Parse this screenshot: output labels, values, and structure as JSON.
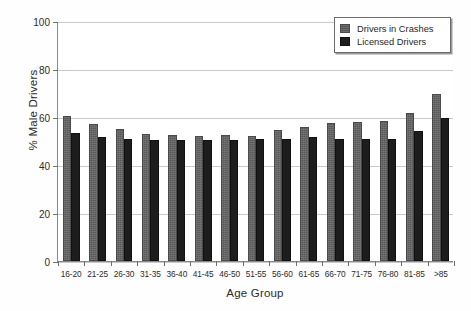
{
  "chart_data": {
    "type": "bar",
    "title": "",
    "xlabel": "Age Group",
    "ylabel": "% Male Drivers",
    "ylim": [
      0,
      100
    ],
    "yticks": [
      0,
      20,
      40,
      60,
      80,
      100
    ],
    "grid": true,
    "legend_position": "top-right",
    "categories": [
      "16-20",
      "21-25",
      "26-30",
      "31-35",
      "36-40",
      "41-45",
      "46-50",
      "51-55",
      "56-60",
      "61-65",
      "66-70",
      "71-75",
      "76-80",
      "81-85",
      ">85"
    ],
    "series": [
      {
        "name": "Drivers in Crashes",
        "color": "#595959",
        "values": [
          60.5,
          57.0,
          55.0,
          53.0,
          52.5,
          52.0,
          52.5,
          52.0,
          54.5,
          56.0,
          57.5,
          58.0,
          58.5,
          61.5,
          69.5
        ]
      },
      {
        "name": "Licensed Drivers",
        "color": "#1d1d1d",
        "values": [
          53.5,
          51.5,
          51.0,
          50.5,
          50.5,
          50.5,
          50.5,
          51.0,
          51.0,
          51.5,
          51.0,
          51.0,
          51.0,
          54.0,
          59.5
        ]
      }
    ]
  },
  "axes": {
    "y_title": "% Male Drivers",
    "x_title": "Age Group",
    "y_tick_labels": [
      "0",
      "20",
      "40",
      "60",
      "80",
      "100"
    ]
  },
  "legend": {
    "items": [
      {
        "label": "Drivers in Crashes",
        "swatch": "series-crashes"
      },
      {
        "label": "Licensed Drivers",
        "swatch": "series-licensed"
      }
    ]
  }
}
